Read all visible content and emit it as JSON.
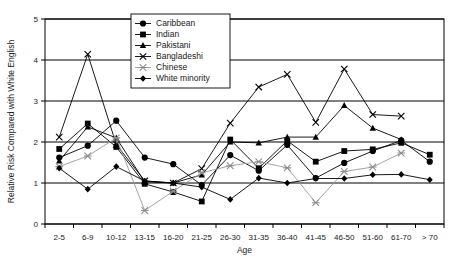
{
  "chart_data": {
    "type": "line",
    "title": "",
    "xlabel": "Age",
    "ylabel": "Relative Risk Compared with White English",
    "ylim": [
      0,
      5
    ],
    "yticks": [
      0,
      1,
      2,
      3,
      4,
      5
    ],
    "ytick_labels": [
      "0",
      "1",
      "2",
      "3",
      "4",
      "5"
    ],
    "grid": "horizontal",
    "legend_position": "top-center",
    "categories": [
      "2-5",
      "6-9",
      "10-12",
      "13-15",
      "16-20",
      "21-25",
      "26-30",
      "31-35",
      "36-40",
      "41-45",
      "46-50",
      "51-60",
      "61-70",
      "> 70"
    ],
    "series": [
      {
        "name": "Caribbean",
        "marker": "circle",
        "color": "#000000",
        "values": [
          1.62,
          1.91,
          2.52,
          1.62,
          1.46,
          0.95,
          1.68,
          1.3,
          1.93,
          1.12,
          1.49,
          1.78,
          2.04,
          1.52
        ]
      },
      {
        "name": "Indian",
        "marker": "square",
        "color": "#000000",
        "values": [
          1.83,
          2.45,
          1.88,
          0.98,
          0.78,
          0.55,
          2.06,
          1.36,
          2.03,
          1.52,
          1.78,
          1.82,
          1.98,
          1.69
        ]
      },
      {
        "name": "Pakistani",
        "marker": "triangle",
        "color": "#000000",
        "values": [
          1.54,
          2.37,
          2.1,
          1.03,
          1.0,
          1.2,
          2.0,
          1.98,
          2.12,
          2.12,
          2.89,
          2.34,
          2.06,
          null
        ]
      },
      {
        "name": "Bangladeshi",
        "marker": "cross",
        "color": "#000000",
        "values": [
          2.12,
          4.14,
          1.94,
          1.05,
          1.0,
          1.35,
          2.46,
          3.34,
          3.65,
          2.48,
          3.78,
          2.67,
          2.63,
          null
        ]
      },
      {
        "name": "Chinese",
        "marker": "star",
        "color": "#8e8e8e",
        "values": [
          1.4,
          1.66,
          2.1,
          0.33,
          0.8,
          1.25,
          1.42,
          1.52,
          1.37,
          0.52,
          1.28,
          1.39,
          1.73,
          null
        ]
      },
      {
        "name": "White minority",
        "marker": "diamond",
        "color": "#000000",
        "values": [
          1.36,
          0.85,
          1.4,
          1.05,
          1.0,
          0.9,
          0.6,
          1.12,
          1.0,
          1.11,
          1.11,
          1.2,
          1.21,
          1.08
        ]
      }
    ]
  },
  "legend": {
    "items": [
      {
        "label": "Caribbean"
      },
      {
        "label": "Indian"
      },
      {
        "label": "Pakistani"
      },
      {
        "label": "Bangladeshi"
      },
      {
        "label": "Chinese"
      },
      {
        "label": "White minority"
      }
    ]
  }
}
